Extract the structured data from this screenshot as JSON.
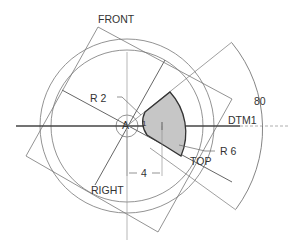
{
  "diagram": {
    "datum_planes": {
      "front": "FRONT",
      "top": "TOP",
      "right": "RIGHT",
      "axis": "DTM1"
    },
    "center_label": "A",
    "center_sub_label": "1",
    "dimensions": {
      "radius_small": "R 2",
      "radius_large": "R 6",
      "linear": "4",
      "angle": "80"
    },
    "colors": {
      "line": "#555555",
      "sector_fill": "#c8c8c8",
      "sector_stroke": "#333333",
      "text": "#333333"
    }
  }
}
